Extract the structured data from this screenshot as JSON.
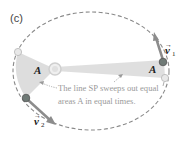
{
  "panel": {
    "label": "(c)"
  },
  "areas": {
    "left_label": "A",
    "right_label": "A"
  },
  "vectors": {
    "v1": {
      "symbol": "v",
      "subscript": "1"
    },
    "v2": {
      "symbol": "v",
      "subscript": "2"
    }
  },
  "caption": {
    "line1": "The line SP sweeps out equal",
    "line2": "areas A in equal times."
  },
  "colors": {
    "orbit": "#8a8a8a",
    "swept_area": "#d9d9d9",
    "sun": "#e6e6e6",
    "planet_dark": "#6f7a76",
    "planet_light": "#e8e8e8",
    "velocity_arrow": "#8c8c8c",
    "caption_text": "#9a9a9a"
  }
}
